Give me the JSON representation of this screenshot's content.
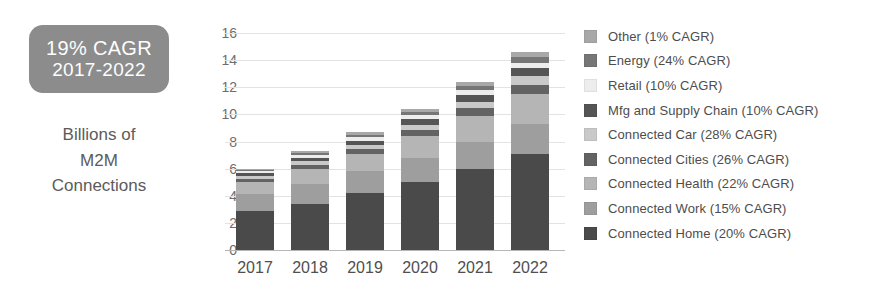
{
  "left_panel": {
    "badge": {
      "line1": "19% CAGR",
      "line2": "2017-2022",
      "bg_color": "#8c8c8c",
      "text_color": "#ffffff"
    },
    "caption": "Billions of\nM2M\nConnections"
  },
  "chart_data": {
    "type": "bar",
    "stacked": true,
    "title": "",
    "subtitle": "",
    "xlabel": "",
    "ylabel": "Billions of M2M Connections",
    "ylim": [
      0,
      16
    ],
    "ytick_step": 2,
    "yticks": [
      "16",
      "14",
      "12",
      "10",
      "8",
      "6",
      "4",
      "2",
      "0"
    ],
    "grid": true,
    "grid_axis": "y",
    "legend_position": "right",
    "legend_order": "reverse-stack",
    "categories": [
      "2017",
      "2018",
      "2019",
      "2020",
      "2021",
      "2022"
    ],
    "totals": [
      6.0,
      7.3,
      8.7,
      10.4,
      12.3,
      14.6
    ],
    "series": [
      {
        "name": "Connected Home (20% CAGR)",
        "short_name": "Connected Home",
        "cagr": "20%",
        "color": "#4a4a4a",
        "values": [
          2.9,
          3.4,
          4.2,
          5.0,
          6.0,
          7.1
        ]
      },
      {
        "name": "Connected Work (15% CAGR)",
        "short_name": "Connected Work",
        "cagr": "15%",
        "color": "#9e9e9e",
        "values": [
          1.2,
          1.5,
          1.6,
          1.8,
          2.0,
          2.2
        ]
      },
      {
        "name": "Connected Health (22% CAGR)",
        "short_name": "Connected Health",
        "cagr": "22%",
        "color": "#b5b5b5",
        "values": [
          0.9,
          1.1,
          1.3,
          1.6,
          1.9,
          2.2
        ]
      },
      {
        "name": "Connected Cities (26% CAGR)",
        "short_name": "Connected Cities",
        "cagr": "26%",
        "color": "#636363",
        "values": [
          0.25,
          0.3,
          0.35,
          0.45,
          0.55,
          0.7
        ]
      },
      {
        "name": "Connected Car (28% CAGR)",
        "short_name": "Connected Car",
        "cagr": "28%",
        "color": "#c9c9c9",
        "values": [
          0.2,
          0.25,
          0.3,
          0.4,
          0.5,
          0.65
        ]
      },
      {
        "name": "Mfg and Supply Chain (10% CAGR)",
        "short_name": "Mfg and Supply Chain",
        "cagr": "10%",
        "color": "#555555",
        "values": [
          0.2,
          0.25,
          0.3,
          0.4,
          0.5,
          0.55
        ]
      },
      {
        "name": "Retail (10% CAGR)",
        "short_name": "Retail",
        "cagr": "10%",
        "color": "#ededed",
        "values": [
          0.15,
          0.2,
          0.25,
          0.3,
          0.35,
          0.4
        ]
      },
      {
        "name": "Energy (24% CAGR)",
        "short_name": "Energy",
        "cagr": "24%",
        "color": "#767676",
        "values": [
          0.1,
          0.15,
          0.2,
          0.25,
          0.3,
          0.4
        ]
      },
      {
        "name": "Other (1% CAGR)",
        "short_name": "Other",
        "cagr": "1%",
        "color": "#a8a8a8",
        "values": [
          0.1,
          0.15,
          0.2,
          0.2,
          0.3,
          0.4
        ]
      }
    ]
  },
  "legend": {
    "items": [
      {
        "label": "Other (1% CAGR)",
        "color": "#a8a8a8"
      },
      {
        "label": "Energy (24% CAGR)",
        "color": "#767676"
      },
      {
        "label": "Retail (10% CAGR)",
        "color": "#ededed"
      },
      {
        "label": "Mfg and Supply Chain (10% CAGR)",
        "color": "#555555"
      },
      {
        "label": "Connected Car (28% CAGR)",
        "color": "#c9c9c9"
      },
      {
        "label": "Connected Cities (26% CAGR)",
        "color": "#636363"
      },
      {
        "label": "Connected Health (22% CAGR)",
        "color": "#b5b5b5"
      },
      {
        "label": "Connected Work (15% CAGR)",
        "color": "#9e9e9e"
      },
      {
        "label": "Connected Home (20% CAGR)",
        "color": "#4a4a4a"
      }
    ]
  }
}
